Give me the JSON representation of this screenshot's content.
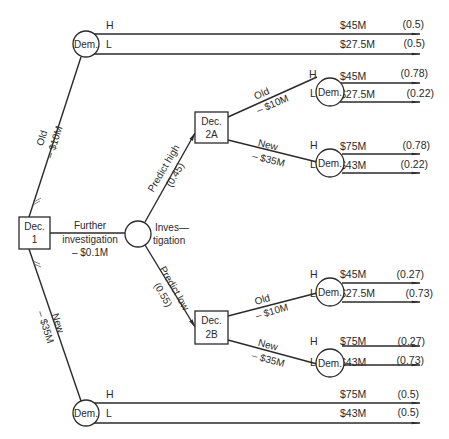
{
  "diagram": {
    "type": "decision-tree",
    "decision_nodes": {
      "dec1": {
        "line1": "Dec.",
        "line2": "1"
      },
      "dec2a": {
        "line1": "Dec.",
        "line2": "2A"
      },
      "dec2b": {
        "line1": "Dec.",
        "line2": "2B"
      }
    },
    "chance_nodes": {
      "demand_label": "Dem.",
      "investigation_label_1": "Inves—",
      "investigation_label_2": "tigation"
    },
    "branches": {
      "dec1_old": {
        "label": "Old",
        "cost": "– $10M"
      },
      "dec1_new": {
        "label": "New",
        "cost": "– $35M"
      },
      "dec1_further": {
        "label_1": "Further",
        "label_2": "investigation",
        "cost": "– $0.1M"
      },
      "predict_high": {
        "label": "Predict high",
        "prob": "(0.45)"
      },
      "predict_low": {
        "label": "Predict low",
        "prob": "(0.55)"
      },
      "dec2a_old": {
        "label": "Old",
        "cost": "– $10M"
      },
      "dec2a_new": {
        "label": "New",
        "cost": "– $35M"
      },
      "dec2b_old": {
        "label": "Old",
        "cost": "– $10M"
      },
      "dec2b_new": {
        "label": "New",
        "cost": "– $35M"
      }
    },
    "outcomes": [
      {
        "id": "top",
        "rows": [
          {
            "state": "H",
            "value": "$45M",
            "prob": "(0.5)"
          },
          {
            "state": "L",
            "value": "$27.5M",
            "prob": "(0.5)"
          }
        ]
      },
      {
        "id": "2a-old",
        "rows": [
          {
            "state": "H",
            "value": "$45M",
            "prob": "(0.78)"
          },
          {
            "state": "L",
            "value": "$27.5M",
            "prob": "(0.22)"
          }
        ]
      },
      {
        "id": "2a-new",
        "rows": [
          {
            "state": "H",
            "value": "$75M",
            "prob": "(0.78)"
          },
          {
            "state": "L",
            "value": "$43M",
            "prob": "(0.22)"
          }
        ]
      },
      {
        "id": "2b-old",
        "rows": [
          {
            "state": "H",
            "value": "$45M",
            "prob": "(0.27)"
          },
          {
            "state": "L",
            "value": "$27.5M",
            "prob": "(0.73)"
          }
        ]
      },
      {
        "id": "2b-new",
        "rows": [
          {
            "state": "H",
            "value": "$75M",
            "prob": "(0.27)"
          },
          {
            "state": "L",
            "value": "$43M",
            "prob": "(0.73)"
          }
        ]
      },
      {
        "id": "bottom",
        "rows": [
          {
            "state": "H",
            "value": "$75M",
            "prob": "(0.5)"
          },
          {
            "state": "L",
            "value": "$43M",
            "prob": "(0.5)"
          }
        ]
      }
    ],
    "colors": {
      "ink": "#2a2a2a",
      "background": "#ffffff"
    }
  }
}
